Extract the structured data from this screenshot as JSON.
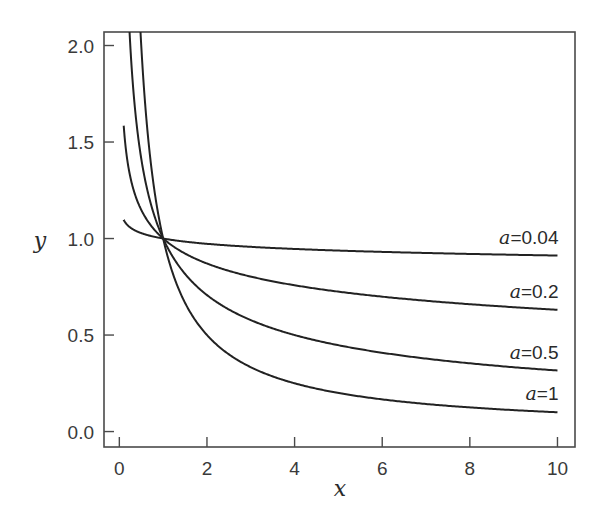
{
  "chart_data": {
    "type": "line",
    "title": "",
    "xlabel": "x",
    "ylabel": "y",
    "function": "y = x^(-a)",
    "xlim": [
      -0.35,
      10.4
    ],
    "ylim": [
      -0.08,
      2.07
    ],
    "xticks": [
      0,
      2,
      4,
      6,
      8,
      10
    ],
    "xtick_labels": [
      "0",
      "2",
      "4",
      "6",
      "8",
      "10"
    ],
    "yticks": [
      0.0,
      0.5,
      1.0,
      1.5,
      2.0
    ],
    "ytick_labels": [
      "0.0",
      "0.5",
      "1.0",
      "1.5",
      "2.0"
    ],
    "grid": false,
    "legend": "inline labels at right end of each curve",
    "series": [
      {
        "name": "a=0.04",
        "param": "a",
        "value_text": "=0.04",
        "a": 0.04,
        "x_start": 0.1,
        "x_end": 10,
        "points": [
          [
            0.1,
            1.096
          ],
          [
            0.5,
            1.028
          ],
          [
            1,
            1.0
          ],
          [
            2,
            0.973
          ],
          [
            4,
            0.946
          ],
          [
            6,
            0.931
          ],
          [
            8,
            0.92
          ],
          [
            10,
            0.912
          ]
        ]
      },
      {
        "name": "a=0.2",
        "param": "a",
        "value_text": "=0.2",
        "a": 0.2,
        "x_start": 0.1,
        "x_end": 10,
        "points": [
          [
            0.1,
            1.585
          ],
          [
            0.5,
            1.149
          ],
          [
            1,
            1.0
          ],
          [
            2,
            0.871
          ],
          [
            4,
            0.758
          ],
          [
            6,
            0.699
          ],
          [
            8,
            0.66
          ],
          [
            10,
            0.631
          ]
        ]
      },
      {
        "name": "a=0.5",
        "param": "a",
        "value_text": "=0.5",
        "a": 0.5,
        "x_start": 0.23,
        "x_end": 10,
        "points": [
          [
            0.25,
            2.0
          ],
          [
            0.5,
            1.414
          ],
          [
            1,
            1.0
          ],
          [
            2,
            0.707
          ],
          [
            4,
            0.5
          ],
          [
            6,
            0.408
          ],
          [
            8,
            0.354
          ],
          [
            10,
            0.316
          ]
        ]
      },
      {
        "name": "a=1",
        "param": "a",
        "value_text": "=1",
        "a": 1,
        "x_start": 0.48,
        "x_end": 10,
        "points": [
          [
            0.5,
            2.0
          ],
          [
            1,
            1.0
          ],
          [
            2,
            0.5
          ],
          [
            4,
            0.25
          ],
          [
            6,
            0.167
          ],
          [
            8,
            0.125
          ],
          [
            10,
            0.1
          ]
        ]
      }
    ]
  }
}
